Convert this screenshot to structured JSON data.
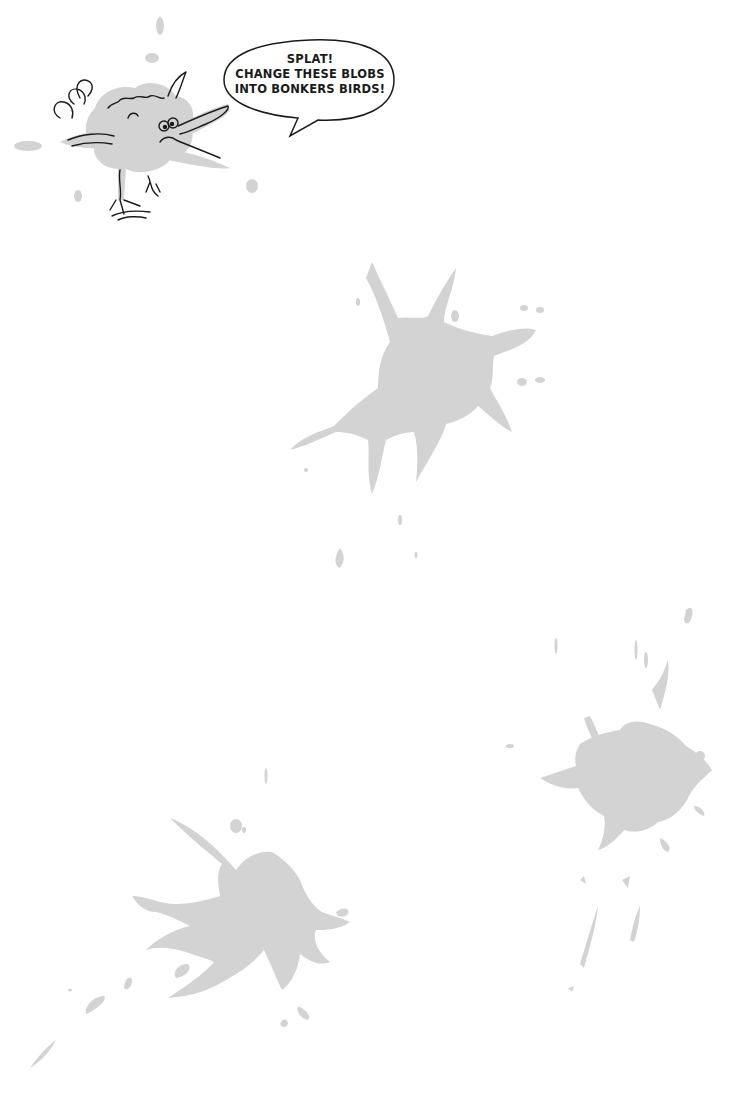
{
  "page": {
    "background": "#ffffff",
    "blob_color": "#d3d3d3",
    "ink_color": "#1a1a1a"
  },
  "speech_bubble": {
    "lines": [
      "SPLAT!",
      "CHANGE THESE BLOBS",
      "INTO BONKERS BIRDS!"
    ]
  },
  "illustrations": {
    "example_bird": "cartoon bird drawn over an ink blob",
    "blobs": [
      "blob-center",
      "blob-bottom-right",
      "blob-bottom-left"
    ]
  }
}
